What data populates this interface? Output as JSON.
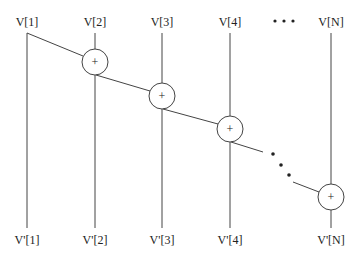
{
  "diagram": {
    "type": "prefix-sum adder chain",
    "colors": {
      "stroke": "#444444",
      "text": "#222222",
      "background": "#ffffff"
    },
    "inputs": [
      {
        "label": "V[1]",
        "x": 27
      },
      {
        "label": "V[2]",
        "x": 95
      },
      {
        "label": "V[3]",
        "x": 162
      },
      {
        "label": "V[4]",
        "x": 230
      },
      {
        "label": "V[N]",
        "x": 331
      }
    ],
    "outputs": [
      {
        "label": "V'[1]",
        "x": 27
      },
      {
        "label": "V'[2]",
        "x": 95
      },
      {
        "label": "V'[3]",
        "x": 162
      },
      {
        "label": "V'[4]",
        "x": 230
      },
      {
        "label": "V'[N]",
        "x": 331
      }
    ],
    "adders": [
      {
        "symbol": "+",
        "cx": 95,
        "cy": 62
      },
      {
        "symbol": "+",
        "cx": 162,
        "cy": 96
      },
      {
        "symbol": "+",
        "cx": 230,
        "cy": 129
      },
      {
        "symbol": "+",
        "cx": 331,
        "cy": 197
      }
    ],
    "ellipsis_top": "• • •",
    "ellipsis_chain": [
      "•",
      "•",
      "•"
    ]
  }
}
